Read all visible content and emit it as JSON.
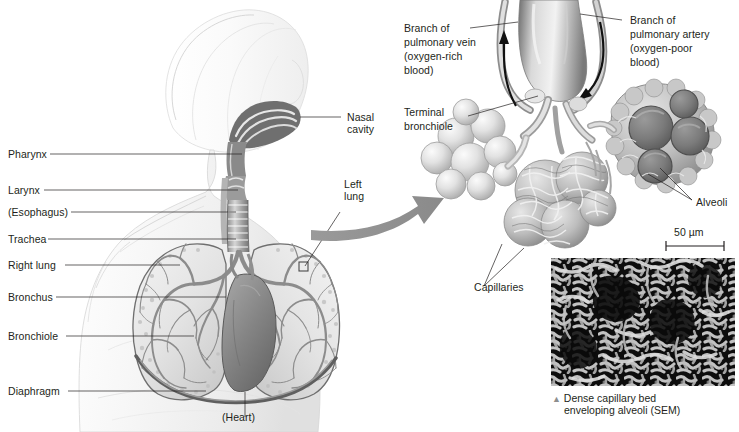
{
  "figure": {
    "type": "anatomical-diagram"
  },
  "left_panel": {
    "name": "human-torso-respiratory-anatomy",
    "labels": [
      {
        "id": "pharynx",
        "text": "Pharynx"
      },
      {
        "id": "larynx",
        "text": "Larynx"
      },
      {
        "id": "esophagus",
        "text": "(Esophagus)"
      },
      {
        "id": "trachea",
        "text": "Trachea"
      },
      {
        "id": "right-lung",
        "text": "Right lung"
      },
      {
        "id": "bronchus",
        "text": "Bronchus"
      },
      {
        "id": "bronchiole",
        "text": "Bronchiole"
      },
      {
        "id": "diaphragm",
        "text": "Diaphragm"
      }
    ],
    "right_labels": [
      {
        "id": "nasal-cavity",
        "line1": "Nasal",
        "line2": "cavity"
      },
      {
        "id": "left-lung",
        "line1": "Left",
        "line2": "lung"
      }
    ],
    "heart_label": "(Heart)"
  },
  "right_panel": {
    "name": "alveoli-enlargement",
    "labels": {
      "pulmonary_vein": {
        "line1": "Branch of",
        "line2": "pulmonary vein",
        "line3": "(oxygen-rich",
        "line4": "blood)"
      },
      "pulmonary_artery": {
        "line1": "Branch of",
        "line2": "pulmonary artery",
        "line3": "(oxygen-poor",
        "line4": "blood)"
      },
      "terminal_bronchiole": {
        "line1": "Terminal",
        "line2": "bronchiole"
      },
      "alveoli": "Alveoli",
      "capillaries": "Capillaries"
    },
    "scale_bar": "50 µm"
  },
  "micrograph": {
    "name": "sem-capillary-bed",
    "caption_marker": "▲",
    "caption_line1": "Dense capillary bed",
    "caption_line2": "enveloping alveoli (SEM)"
  },
  "colors": {
    "text": "#231f20",
    "leader": "#231f20",
    "arrow": "#8a8a8a",
    "tissue_dark": "#6e6e6e",
    "tissue_mid": "#a9a9a9",
    "tissue_light": "#d8d8d8",
    "sem_bg": "#111111"
  }
}
